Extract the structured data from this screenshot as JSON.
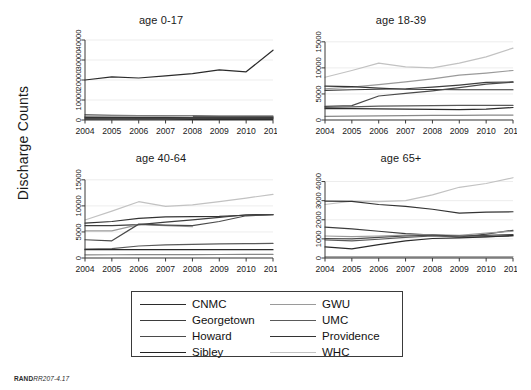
{
  "figure": {
    "ylabel": "Discharge Counts",
    "footer_brand": "RAND",
    "footer_code": "RR207-4.17"
  },
  "legend": {
    "items": [
      {
        "label": "CNMC",
        "color": "#2b2b2b"
      },
      {
        "label": "GWU",
        "color": "#9a9a9a"
      },
      {
        "label": "Georgetown",
        "color": "#3d3d3d"
      },
      {
        "label": "UMC",
        "color": "#5a5a5a"
      },
      {
        "label": "Howard",
        "color": "#4a4a4a"
      },
      {
        "label": "Providence",
        "color": "#333333"
      },
      {
        "label": "Sibley",
        "color": "#222222"
      },
      {
        "label": "WHC",
        "color": "#c2c2c2"
      }
    ]
  },
  "chart_data": [
    {
      "type": "line",
      "title": "age 0-17",
      "xlabel": "",
      "ylabel": "Discharge Counts",
      "x": [
        2004,
        2005,
        2006,
        2007,
        2008,
        2009,
        2010,
        2011
      ],
      "xticks": [
        "2004",
        "2005",
        "2006",
        "2007",
        "2008",
        "2009",
        "2010",
        "2011"
      ],
      "yticks": [
        0,
        10000,
        20000,
        30000,
        40000
      ],
      "ytick_labels": [
        "0",
        "10000",
        "20000",
        "30000",
        "40000"
      ],
      "ylim": [
        0,
        43000
      ],
      "grid": true,
      "legend_position": "below-figure",
      "series": [
        {
          "name": "CNMC",
          "color": "#2b2b2b",
          "values": [
            20000,
            21600,
            21000,
            22100,
            23200,
            25100,
            24100,
            34900
          ]
        },
        {
          "name": "GWU",
          "color": "#9a9a9a",
          "values": [
            1450,
            1400,
            1380,
            1330,
            1300,
            1280,
            1250,
            1200
          ]
        },
        {
          "name": "Georgetown",
          "color": "#3d3d3d",
          "values": [
            2600,
            2350,
            2200,
            2100,
            2050,
            2000,
            1950,
            1900
          ]
        },
        {
          "name": "UMC",
          "color": "#5a5a5a",
          "values": [
            900,
            880,
            860,
            840,
            830,
            820,
            800,
            780
          ]
        },
        {
          "name": "Howard",
          "color": "#4a4a4a",
          "values": [
            1700,
            1650,
            1620,
            1580,
            1560,
            1540,
            1500,
            1480
          ]
        },
        {
          "name": "Providence",
          "color": "#333333",
          "values": [
            1200,
            1180,
            1160,
            1140,
            1120,
            1100,
            1080,
            1060
          ]
        },
        {
          "name": "Sibley",
          "color": "#222222",
          "values": [
            400,
            390,
            380,
            370,
            360,
            350,
            340,
            330
          ]
        },
        {
          "name": "WHC",
          "color": "#c2c2c2",
          "values": [
            2000,
            1950,
            1900,
            1880,
            1850,
            0,
            0,
            0
          ]
        }
      ]
    },
    {
      "type": "line",
      "title": "age 18-39",
      "xlabel": "",
      "ylabel": "Discharge Counts",
      "x": [
        2004,
        2005,
        2006,
        2007,
        2008,
        2009,
        2010,
        2011
      ],
      "xticks": [
        "2004",
        "2005",
        "2006",
        "2007",
        "2008",
        "2009",
        "2010",
        "2011"
      ],
      "yticks": [
        0,
        5000,
        10000,
        15000
      ],
      "ytick_labels": [
        "0",
        "5000",
        "10000",
        "15000"
      ],
      "ylim": [
        0,
        16500
      ],
      "grid": true,
      "legend_position": "below-figure",
      "series": [
        {
          "name": "WHC",
          "color": "#c2c2c2",
          "values": [
            8200,
            9500,
            10900,
            10200,
            10000,
            10900,
            12100,
            13800
          ]
        },
        {
          "name": "GWU",
          "color": "#9a9a9a",
          "values": [
            6000,
            6300,
            6800,
            7300,
            7900,
            8600,
            9000,
            9500
          ]
        },
        {
          "name": "Providence",
          "color": "#333333",
          "values": [
            6500,
            6400,
            6100,
            5900,
            5850,
            5800,
            5800,
            5800
          ]
        },
        {
          "name": "Georgetown",
          "color": "#3d3d3d",
          "values": [
            5700,
            5800,
            5900,
            6000,
            6300,
            6700,
            7200,
            7300
          ]
        },
        {
          "name": "Howard",
          "color": "#4a4a4a",
          "values": [
            2600,
            2750,
            4600,
            5100,
            5600,
            6200,
            6900,
            7250
          ]
        },
        {
          "name": "UMC",
          "color": "#5a5a5a",
          "values": [
            2400,
            2500,
            2650,
            2700,
            2750,
            2800,
            2800,
            2800
          ]
        },
        {
          "name": "CNMC",
          "color": "#2b2b2b",
          "values": [
            2200,
            2200,
            2150,
            2100,
            2050,
            2000,
            2100,
            2400
          ]
        },
        {
          "name": "Sibley",
          "color": "#888888",
          "values": [
            700,
            750,
            800,
            850,
            880,
            900,
            920,
            950
          ]
        }
      ]
    },
    {
      "type": "line",
      "title": "age 40-64",
      "xlabel": "",
      "ylabel": "Discharge Counts",
      "x": [
        2004,
        2005,
        2006,
        2007,
        2008,
        2009,
        2010,
        2011
      ],
      "xticks": [
        "2004",
        "2005",
        "2006",
        "2007",
        "2008",
        "2009",
        "2010",
        "2011"
      ],
      "yticks": [
        0,
        5000,
        10000,
        15000
      ],
      "ytick_labels": [
        "0",
        "5000",
        "10000",
        "15000"
      ],
      "ylim": [
        0,
        16500
      ],
      "grid": true,
      "legend_position": "below-figure",
      "series": [
        {
          "name": "WHC",
          "color": "#c2c2c2",
          "values": [
            7300,
            9000,
            10800,
            9900,
            10200,
            10800,
            11500,
            12200
          ]
        },
        {
          "name": "Providence",
          "color": "#333333",
          "values": [
            6700,
            7000,
            7600,
            7900,
            7950,
            8000,
            8200,
            8300
          ]
        },
        {
          "name": "Georgetown",
          "color": "#3d3d3d",
          "values": [
            6200,
            6200,
            6400,
            6900,
            7300,
            7800,
            8300,
            8350
          ]
        },
        {
          "name": "GWU",
          "color": "#9a9a9a",
          "values": [
            5200,
            5200,
            6400,
            6200,
            6000,
            0,
            0,
            0
          ]
        },
        {
          "name": "Howard",
          "color": "#4a4a4a",
          "values": [
            3500,
            3300,
            6500,
            6300,
            6200,
            7000,
            8100,
            8300
          ]
        },
        {
          "name": "UMC",
          "color": "#5a5a5a",
          "values": [
            1700,
            1800,
            2300,
            2500,
            2600,
            2700,
            2750,
            2800
          ]
        },
        {
          "name": "CNMC",
          "color": "#2b2b2b",
          "values": [
            1600,
            1600,
            1600,
            1600,
            1600,
            1600,
            1600,
            1600
          ]
        },
        {
          "name": "Sibley",
          "color": "#888888",
          "values": [
            600,
            620,
            640,
            650,
            660,
            670,
            680,
            690
          ]
        }
      ]
    },
    {
      "type": "line",
      "title": "age 65+",
      "xlabel": "",
      "ylabel": "Discharge Counts",
      "x": [
        2004,
        2005,
        2006,
        2007,
        2008,
        2009,
        2010,
        2011
      ],
      "xticks": [
        "2004",
        "2005",
        "2006",
        "2007",
        "2008",
        "2009",
        "2010",
        "2011"
      ],
      "yticks": [
        0,
        1000,
        2000,
        3000,
        4000
      ],
      "ytick_labels": [
        "0",
        "1000",
        "2000",
        "3000",
        "4000"
      ],
      "ylim": [
        0,
        4500
      ],
      "grid": true,
      "legend_position": "below-figure",
      "series": [
        {
          "name": "WHC",
          "color": "#c2c2c2",
          "values": [
            2800,
            2980,
            2950,
            3000,
            3300,
            3700,
            3900,
            4200
          ]
        },
        {
          "name": "Providence",
          "color": "#333333",
          "values": [
            2980,
            2960,
            2800,
            2700,
            2550,
            2350,
            2400,
            2420
          ]
        },
        {
          "name": "Georgetown",
          "color": "#3d3d3d",
          "values": [
            1620,
            1520,
            1400,
            1280,
            1200,
            1100,
            1250,
            1450
          ]
        },
        {
          "name": "GWU",
          "color": "#9a9a9a",
          "values": [
            1150,
            1120,
            1150,
            1200,
            1230,
            1180,
            1300,
            1400
          ]
        },
        {
          "name": "Howard",
          "color": "#4a4a4a",
          "values": [
            1020,
            1000,
            1080,
            1150,
            1200,
            1150,
            1180,
            1230
          ]
        },
        {
          "name": "UMC",
          "color": "#5a5a5a",
          "values": [
            950,
            900,
            980,
            1080,
            1150,
            1100,
            1120,
            1150
          ]
        },
        {
          "name": "CNMC",
          "color": "#2b2b2b",
          "values": [
            580,
            480,
            700,
            900,
            1020,
            1050,
            1100,
            1180
          ]
        },
        {
          "name": "Sibley",
          "color": "#888888",
          "values": [
            60,
            60,
            60,
            60,
            60,
            60,
            60,
            60
          ]
        }
      ]
    }
  ]
}
